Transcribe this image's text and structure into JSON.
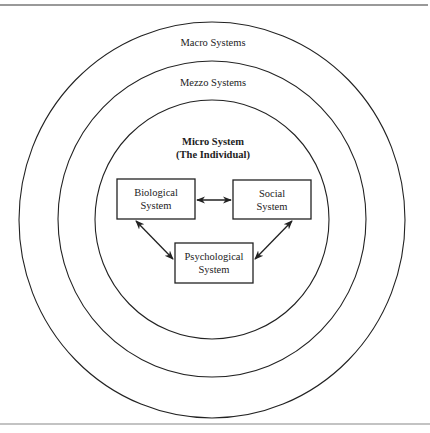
{
  "diagram": {
    "type": "nested-systems",
    "colors": {
      "stroke": "#222222",
      "rule": "#777777",
      "background": "#ffffff"
    },
    "rings": [
      {
        "id": "macro",
        "label": "Macro Systems"
      },
      {
        "id": "mezzo",
        "label": "Mezzo Systems"
      },
      {
        "id": "micro",
        "title_line1": "Micro System",
        "title_line2": "(The Individual)"
      }
    ],
    "boxes": [
      {
        "id": "biological",
        "line1": "Biological",
        "line2": "System"
      },
      {
        "id": "social",
        "line1": "Social",
        "line2": "System"
      },
      {
        "id": "psychological",
        "line1": "Psychological",
        "line2": "System"
      }
    ],
    "arrows": [
      {
        "from": "biological",
        "to": "social",
        "style": "bidirectional"
      },
      {
        "from": "biological",
        "to": "psychological",
        "style": "bidirectional"
      },
      {
        "from": "social",
        "to": "psychological",
        "style": "bidirectional"
      }
    ]
  }
}
